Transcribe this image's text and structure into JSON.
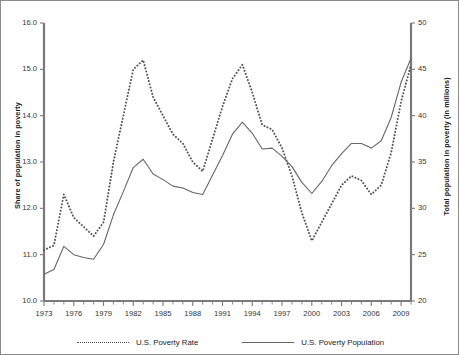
{
  "chart_data": {
    "type": "line",
    "title": "",
    "xlabel": "",
    "ylabel": "Share of population in poverty",
    "y2label": "Total population in poverty (in millions)",
    "grid": false,
    "legend_position": "bottom",
    "xlim": [
      1973,
      2010
    ],
    "ylim": [
      10.0,
      16.0
    ],
    "y2lim": [
      20,
      50
    ],
    "x": [
      1973,
      1974,
      1975,
      1976,
      1977,
      1978,
      1979,
      1980,
      1981,
      1982,
      1983,
      1984,
      1985,
      1986,
      1987,
      1988,
      1989,
      1990,
      1991,
      1992,
      1993,
      1994,
      1995,
      1996,
      1997,
      1998,
      1999,
      2000,
      2001,
      2002,
      2003,
      2004,
      2005,
      2006,
      2007,
      2008,
      2009,
      2010
    ],
    "xticks": [
      1973,
      1976,
      1979,
      1982,
      1985,
      1988,
      1991,
      1994,
      1997,
      2000,
      2003,
      2006,
      2009
    ],
    "xtick_labels": [
      "1973",
      "1976",
      "1979",
      "1982",
      "1985",
      "1988",
      "1991",
      "1994",
      "1997",
      "2000",
      "2003",
      "2006",
      "2009"
    ],
    "yticks": [
      10.0,
      11.0,
      12.0,
      13.0,
      14.0,
      15.0,
      16.0
    ],
    "ytick_labels": [
      "10.0",
      "11.0",
      "12.0",
      "13.0",
      "14.0",
      "15.0",
      "16.0"
    ],
    "y2ticks": [
      20,
      25,
      30,
      35,
      40,
      45,
      50
    ],
    "y2tick_labels": [
      "20",
      "25",
      "30",
      "35",
      "40",
      "45",
      "50"
    ],
    "series": [
      {
        "name": "U.S. Poverty Rate",
        "axis": "left",
        "style": "dotted",
        "color": "#555555",
        "units": "percent",
        "values": [
          11.1,
          11.2,
          12.3,
          11.8,
          11.6,
          11.4,
          11.7,
          13.0,
          14.0,
          15.0,
          15.2,
          14.4,
          14.0,
          13.6,
          13.4,
          13.0,
          12.8,
          13.5,
          14.2,
          14.8,
          15.1,
          14.5,
          13.8,
          13.7,
          13.3,
          12.7,
          11.9,
          11.3,
          11.7,
          12.1,
          12.5,
          12.7,
          12.6,
          12.3,
          12.5,
          13.2,
          14.3,
          15.1
        ]
      },
      {
        "name": "U.S. Poverty Population",
        "axis": "right",
        "style": "solid",
        "color": "#666666",
        "units": "millions",
        "values": [
          22.9,
          23.4,
          25.9,
          25.0,
          24.7,
          24.5,
          26.1,
          29.3,
          31.8,
          34.4,
          35.3,
          33.7,
          33.1,
          32.4,
          32.2,
          31.7,
          31.5,
          33.6,
          35.7,
          38.0,
          39.3,
          38.1,
          36.4,
          36.5,
          35.6,
          34.5,
          32.8,
          31.6,
          32.9,
          34.6,
          35.9,
          37.0,
          37.0,
          36.5,
          37.3,
          39.8,
          43.6,
          46.2
        ]
      }
    ]
  }
}
